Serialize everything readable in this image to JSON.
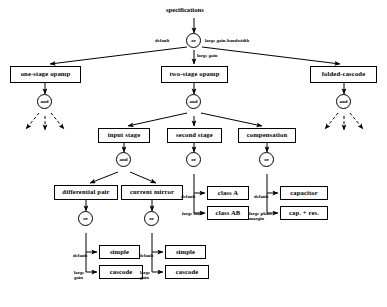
{
  "diagram": {
    "title": "specifications",
    "root": {
      "label": "specifications"
    },
    "operators": {
      "root_or": "or",
      "one_stage_and": "and",
      "two_stage_and": "and",
      "folded_and": "and",
      "input_stage_and": "and",
      "second_stage_or": "or",
      "compensation_or": "or",
      "diff_pair_or": "or",
      "current_mirror_or": "or"
    },
    "boxes": {
      "one_stage_opamp": "one-stage opamp",
      "two_stage_opamp": "two-stage opamp",
      "folded_cascode": "folded-cascode",
      "input_stage": "input stage",
      "second_stage": "second stage",
      "compensation": "compensation",
      "differential_pair": "differential pair",
      "current_mirror": "current mirror",
      "class_a": "class A",
      "class_ab": "class AB",
      "capacitor": "capacitor",
      "cap_plus_res": "cap. + res.",
      "diff_simple": "simple",
      "diff_cascode": "cascode",
      "mirror_simple": "simple",
      "mirror_cascode": "cascode"
    },
    "edge_labels": {
      "root_default": "default",
      "root_large_gain_bandwidth": "large gain-bandwidth",
      "root_large_gain": "large gain",
      "second_stage_default": "default",
      "second_stage_large_load": "large load",
      "compensation_default": "default",
      "compensation_large_phase_margin": "large phase margin",
      "diff_default": "default",
      "diff_large_gain": "large gain",
      "mirror_default": "default",
      "mirror_large_gain": "large gain"
    },
    "colors": {
      "stroke": "#000000",
      "fill": "#ffffff",
      "text": "#000000"
    }
  }
}
